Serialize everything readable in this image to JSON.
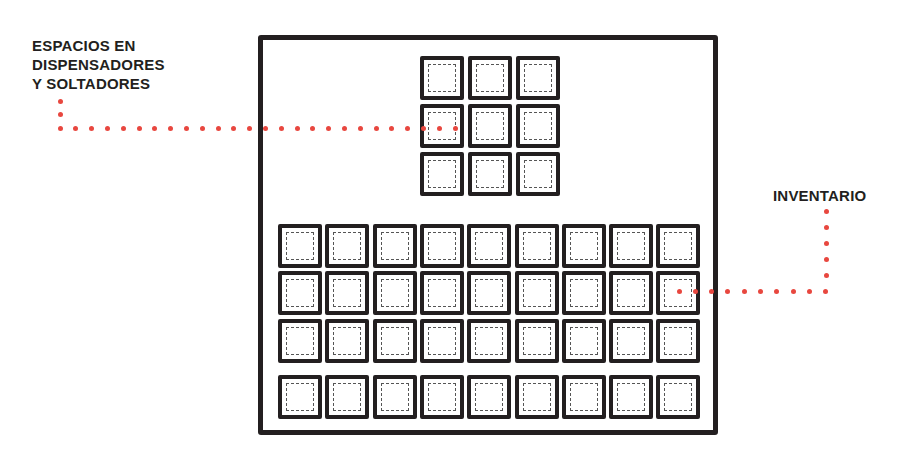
{
  "labels": {
    "dispenser": [
      "ESPACIOS EN",
      "DISPENSADORES",
      "Y SOLTADORES"
    ],
    "inventory": "INVENTARIO"
  },
  "grid": {
    "dispenser": {
      "rows": 3,
      "cols": 3
    },
    "inventory": {
      "rows": 3,
      "cols": 9
    },
    "hotbar": {
      "rows": 1,
      "cols": 9
    }
  },
  "colors": {
    "outline": "#231f20",
    "leader_dots": "#e8473f"
  }
}
